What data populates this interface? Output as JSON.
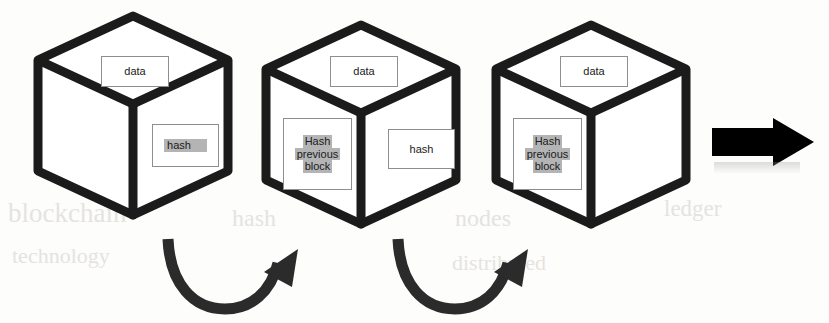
{
  "diagram": {
    "colors": {
      "cube_stroke": "#1b1b1b",
      "box_border": "#8e8e8e",
      "highlight": "#b4b4b4",
      "arrow_fill": "#000000",
      "curve_arrow_fill": "#2b2b2b",
      "background": "#fdfdfc"
    },
    "blocks": [
      {
        "name": "block-1",
        "top_label": {
          "lines": [
            "data"
          ],
          "highlighted": false
        },
        "left_label": null,
        "right_label": {
          "lines": [
            "hash"
          ],
          "highlighted": true
        }
      },
      {
        "name": "block-2",
        "top_label": {
          "lines": [
            "data"
          ],
          "highlighted": false
        },
        "left_label": {
          "lines": [
            "Hash",
            "previous",
            "block"
          ],
          "highlighted": true
        },
        "right_label": {
          "lines": [
            "hash"
          ],
          "highlighted": false
        }
      },
      {
        "name": "block-3",
        "top_label": {
          "lines": [
            "data"
          ],
          "highlighted": false
        },
        "left_label": {
          "lines": [
            "Hash",
            "previous",
            "block"
          ],
          "highlighted": true
        },
        "right_label": null
      }
    ],
    "connectors": [
      {
        "name": "curved-arrow-1",
        "from": "block-1",
        "to": "block-2",
        "style": "curved-up-right"
      },
      {
        "name": "curved-arrow-2",
        "from": "block-2",
        "to": "block-3",
        "style": "curved-up-right"
      }
    ],
    "continuation_arrow": {
      "name": "continuation-arrow",
      "direction": "right",
      "style": "solid-block"
    },
    "ghost_text": [
      {
        "text": "blockchain",
        "x": 8,
        "y": 198
      },
      {
        "text": "technology",
        "x": 12,
        "y": 243
      },
      {
        "text": "hash",
        "x": 232,
        "y": 205
      },
      {
        "text": "nodes",
        "x": 455,
        "y": 205
      },
      {
        "text": "distributed",
        "x": 452,
        "y": 250
      },
      {
        "text": "ledger",
        "x": 664,
        "y": 196
      }
    ]
  }
}
